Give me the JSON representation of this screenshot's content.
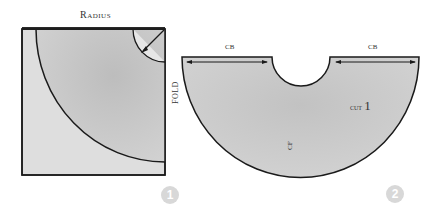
{
  "diagram": {
    "figure1": {
      "top_label": "Radius",
      "side_label": "FOLD",
      "step_number": "1"
    },
    "figure2": {
      "left_label": "CB",
      "right_label": "CB",
      "cut_label": "cut",
      "cut_count": "1",
      "center_label": "CF",
      "step_number": "2"
    },
    "colors": {
      "fill_dark": "#c4c4c4",
      "fill_light": "#dcdcdc",
      "outline": "#1a1a1a",
      "step_badge": "#d8d8d8"
    }
  }
}
